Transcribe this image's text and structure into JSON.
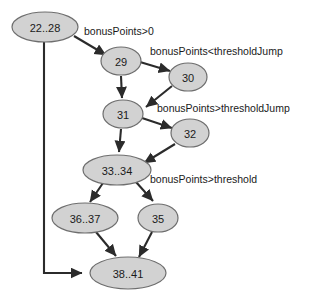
{
  "diagram": {
    "node_fill": "#d2d2d2",
    "node_stroke": "#6e6e6e",
    "edge_color": "#2b2b2b",
    "background": "#ffffff",
    "nodes": [
      {
        "id": "n22_28",
        "label": "22..28",
        "cx": 45,
        "cy": 27,
        "rx": 33,
        "ry": 15
      },
      {
        "id": "n29",
        "label": "29",
        "cx": 121,
        "cy": 61,
        "rx": 20,
        "ry": 14
      },
      {
        "id": "n30",
        "label": "30",
        "cx": 188,
        "cy": 77,
        "rx": 19,
        "ry": 14
      },
      {
        "id": "n31",
        "label": "31",
        "cx": 123,
        "cy": 114,
        "rx": 20,
        "ry": 14
      },
      {
        "id": "n32",
        "label": "32",
        "cx": 190,
        "cy": 133,
        "rx": 19,
        "ry": 14
      },
      {
        "id": "n33_34",
        "label": "33..34",
        "cx": 117,
        "cy": 170,
        "rx": 34,
        "ry": 15
      },
      {
        "id": "n36_37",
        "label": "36..37",
        "cx": 85,
        "cy": 218,
        "rx": 33,
        "ry": 15
      },
      {
        "id": "n35",
        "label": "35",
        "cx": 158,
        "cy": 218,
        "rx": 20,
        "ry": 14
      },
      {
        "id": "n38_41",
        "label": "38..41",
        "cx": 128,
        "cy": 273,
        "rx": 38,
        "ry": 16
      }
    ],
    "edges": [
      {
        "id": "e_22_29",
        "from": "22..28",
        "to": "29",
        "label": "bonusPoints>0"
      },
      {
        "id": "e_29_30",
        "from": "29",
        "to": "30",
        "label": "bonusPoints<thresholdJump"
      },
      {
        "id": "e_29_31",
        "from": "29",
        "to": "31",
        "label": ""
      },
      {
        "id": "e_30_31",
        "from": "30",
        "to": "31",
        "label": ""
      },
      {
        "id": "e_31_32",
        "from": "31",
        "to": "32",
        "label": "bonusPoints>thresholdJump"
      },
      {
        "id": "e_31_33",
        "from": "31",
        "to": "33..34",
        "label": ""
      },
      {
        "id": "e_32_33",
        "from": "32",
        "to": "33..34",
        "label": ""
      },
      {
        "id": "e_33_36",
        "from": "33..34",
        "to": "36..37",
        "label": ""
      },
      {
        "id": "e_33_35",
        "from": "33..34",
        "to": "35",
        "label": "bonusPoints>threshold"
      },
      {
        "id": "e_36_38",
        "from": "36..37",
        "to": "38..41",
        "label": ""
      },
      {
        "id": "e_35_38",
        "from": "35",
        "to": "38..41",
        "label": ""
      },
      {
        "id": "e_22_38",
        "from": "22..28",
        "to": "38..41",
        "label": ""
      }
    ],
    "edge_labels": [
      {
        "id": "lbl_bonus_gt0",
        "text": "bonusPoints>0",
        "x": 84,
        "y": 32
      },
      {
        "id": "lbl_lt_jump",
        "text": "bonusPoints<thresholdJump",
        "x": 150,
        "y": 52
      },
      {
        "id": "lbl_gt_jump",
        "text": "bonusPoints>thresholdJump",
        "x": 157,
        "y": 109
      },
      {
        "id": "lbl_gt_threshold",
        "text": "bonusPoints>threshold",
        "x": 150,
        "y": 180
      }
    ]
  }
}
